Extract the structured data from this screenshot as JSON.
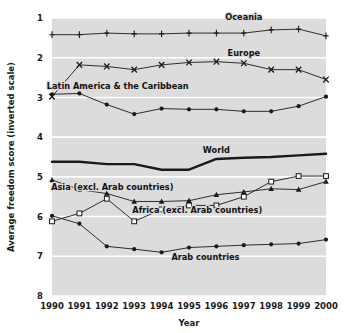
{
  "chart_data": {
    "type": "line",
    "title": "",
    "xlabel": "Year",
    "ylabel": "Average freedom score (inverted scale)",
    "x": [
      1990,
      1991,
      1992,
      1993,
      1994,
      1995,
      1996,
      1997,
      1998,
      1999,
      2000
    ],
    "xticklabels": [
      "1990",
      "1991",
      "1992",
      "1993",
      "1994",
      "1995",
      "1996",
      "1997",
      "1998",
      "1999",
      "2000"
    ],
    "yticklabels": [
      "1",
      "2",
      "3",
      "4",
      "5",
      "6",
      "7",
      "8"
    ],
    "ylim": [
      1,
      8
    ],
    "y_inverted": true,
    "grid": "horizontal-white-on-grey",
    "legend": "inline-annotations",
    "plot_bgcolor": "#dcdcdc",
    "line_color": "#1a1a1a",
    "series": [
      {
        "name": "Oceania",
        "marker": "plus",
        "label_x": 1997,
        "label_y": 1.05,
        "values": [
          1.42,
          1.42,
          1.38,
          1.4,
          1.4,
          1.38,
          1.38,
          1.38,
          1.3,
          1.28,
          1.45
        ]
      },
      {
        "name": "Europe",
        "marker": "cross",
        "label_x": 1997,
        "label_y": 1.95,
        "values": [
          2.98,
          2.18,
          2.22,
          2.3,
          2.18,
          2.12,
          2.1,
          2.14,
          2.3,
          2.3,
          2.55
        ]
      },
      {
        "name": "Latin America & the Caribbean",
        "marker": "filled-circle",
        "label_x": 1992.4,
        "label_y": 2.8,
        "values": [
          2.92,
          2.9,
          3.18,
          3.42,
          3.28,
          3.3,
          3.3,
          3.35,
          3.35,
          3.22,
          2.98
        ]
      },
      {
        "name": "World",
        "marker": "none",
        "thick": true,
        "label_x": 1996,
        "label_y": 4.4,
        "values": [
          4.62,
          4.62,
          4.68,
          4.68,
          4.82,
          4.82,
          4.55,
          4.52,
          4.5,
          4.46,
          4.42
        ]
      },
      {
        "name": "Asia (excl. Arab countries)",
        "marker": "filled-triangle",
        "label_x": 1992.2,
        "label_y": 5.32,
        "values": [
          5.08,
          5.32,
          5.42,
          5.62,
          5.62,
          5.6,
          5.45,
          5.38,
          5.3,
          5.32,
          5.12
        ]
      },
      {
        "name": "Africa (excl. Arab countries)",
        "marker": "open-square",
        "label_x": 1995.3,
        "label_y": 5.92,
        "values": [
          6.12,
          5.92,
          5.55,
          6.12,
          5.82,
          5.72,
          5.72,
          5.5,
          5.12,
          4.98,
          4.98
        ]
      },
      {
        "name": "Arab countries",
        "marker": "filled-circle",
        "label_x": 1995.6,
        "label_y": 7.1,
        "values": [
          5.98,
          6.18,
          6.75,
          6.82,
          6.9,
          6.78,
          6.75,
          6.72,
          6.7,
          6.68,
          6.58
        ]
      }
    ]
  }
}
